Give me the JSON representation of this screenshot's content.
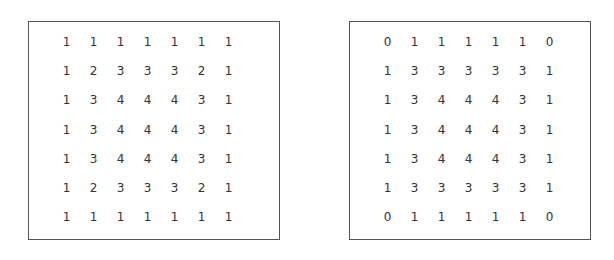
{
  "grids": [
    {
      "id": "left",
      "rows": [
        [
          1,
          1,
          1,
          1,
          1,
          1,
          1
        ],
        [
          1,
          2,
          3,
          3,
          3,
          2,
          1
        ],
        [
          1,
          3,
          4,
          4,
          4,
          3,
          1
        ],
        [
          1,
          3,
          4,
          4,
          4,
          3,
          1
        ],
        [
          1,
          3,
          4,
          4,
          4,
          3,
          1
        ],
        [
          1,
          2,
          3,
          3,
          3,
          2,
          1
        ],
        [
          1,
          1,
          1,
          1,
          1,
          1,
          1
        ]
      ]
    },
    {
      "id": "right",
      "rows": [
        [
          0,
          1,
          1,
          1,
          1,
          1,
          0
        ],
        [
          1,
          3,
          3,
          3,
          3,
          3,
          1
        ],
        [
          1,
          3,
          4,
          4,
          4,
          3,
          1
        ],
        [
          1,
          3,
          4,
          4,
          4,
          3,
          1
        ],
        [
          1,
          3,
          4,
          4,
          4,
          3,
          1
        ],
        [
          1,
          3,
          3,
          3,
          3,
          3,
          1
        ],
        [
          0,
          1,
          1,
          1,
          1,
          1,
          0
        ]
      ]
    }
  ]
}
